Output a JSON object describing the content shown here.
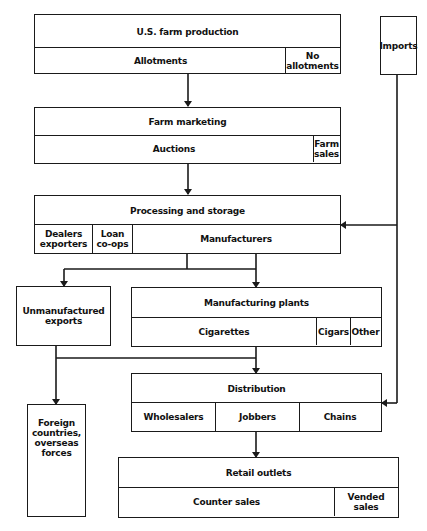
{
  "diagram": {
    "type": "flowchart",
    "nodes": {
      "us_farm_production": {
        "title": "U.S. farm production",
        "parts": [
          "Allotments",
          "No allotments"
        ]
      },
      "imports": {
        "title": "Imports"
      },
      "farm_marketing": {
        "title": "Farm marketing",
        "parts": [
          "Auctions",
          "Farm sales"
        ]
      },
      "processing_storage": {
        "title": "Processing and storage",
        "parts": [
          "Dealers exporters",
          "Loan co-ops",
          "Manufacturers"
        ]
      },
      "unmanufactured_exports": {
        "title": "Unmanufactured exports"
      },
      "manufacturing_plants": {
        "title": "Manufacturing plants",
        "parts": [
          "Cigarettes",
          "Cigars",
          "Other"
        ]
      },
      "distribution": {
        "title": "Distribution",
        "parts": [
          "Wholesalers",
          "Jobbers",
          "Chains"
        ]
      },
      "foreign": {
        "title": "Foreign countries, overseas forces"
      },
      "retail_outlets": {
        "title": "Retail outlets",
        "parts": [
          "Counter sales",
          "Vended sales"
        ]
      }
    },
    "edges": [
      {
        "from": "U.S. farm production",
        "to": "Farm marketing"
      },
      {
        "from": "Farm marketing",
        "to": "Processing and storage"
      },
      {
        "from": "Imports",
        "to": "Processing and storage"
      },
      {
        "from": "Imports",
        "to": "Distribution"
      },
      {
        "from": "Processing and storage",
        "to": "Unmanufactured exports"
      },
      {
        "from": "Processing and storage",
        "to": "Manufacturing plants"
      },
      {
        "from": "Unmanufactured exports",
        "to": "Foreign countries, overseas forces"
      },
      {
        "from": "Unmanufactured exports",
        "to": "Distribution"
      },
      {
        "from": "Manufacturing plants",
        "to": "Distribution"
      },
      {
        "from": "Distribution",
        "to": "Retail outlets"
      }
    ]
  }
}
